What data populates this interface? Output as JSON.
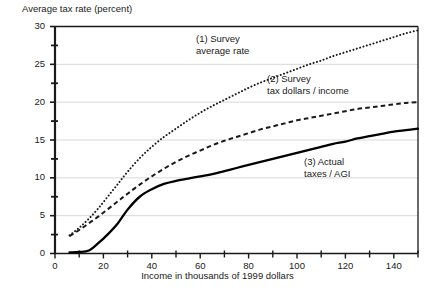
{
  "chart_data": {
    "type": "line",
    "title": "",
    "ylabel": "Average tax rate (percent)",
    "xlabel": "Income in thousands of 1999 dollars",
    "xlim": [
      0,
      150
    ],
    "ylim": [
      0,
      30
    ],
    "grid": true,
    "grid_axis": "y",
    "legend_position": "inline-annotations",
    "y_ticks_major": [
      0,
      5,
      10,
      15,
      20,
      25,
      30
    ],
    "y_ticks_minor": [
      2.5,
      7.5,
      12.5,
      17.5,
      22.5,
      27.5
    ],
    "y_tick_labels": [
      "0",
      "5",
      "10",
      "15",
      "20",
      "25",
      "30"
    ],
    "x_ticks_major": [
      0,
      20,
      40,
      60,
      80,
      100,
      120,
      140
    ],
    "x_ticks_minor": [
      10,
      30,
      50,
      70,
      90,
      110,
      130,
      150
    ],
    "x_tick_labels": [
      "0",
      "20",
      "40",
      "60",
      "80",
      "100",
      "120",
      "140"
    ],
    "series": [
      {
        "name": "(1) Survey average rate",
        "label_line1": "(1) Survey",
        "label_line2": "average rate",
        "style": "dotted",
        "color": "#1a1a1a",
        "x": [
          6,
          10,
          14,
          18,
          22,
          26,
          30,
          35,
          40,
          45,
          50,
          55,
          60,
          65,
          70,
          75,
          80,
          85,
          90,
          95,
          100,
          105,
          110,
          115,
          120,
          125,
          130,
          135,
          140,
          145,
          150
        ],
        "y": [
          2.4,
          3.4,
          4.6,
          6.0,
          7.6,
          9.2,
          10.8,
          12.6,
          14.1,
          15.4,
          16.5,
          17.6,
          18.6,
          19.5,
          20.3,
          21.1,
          21.9,
          22.6,
          23.2,
          23.8,
          24.4,
          25.0,
          25.5,
          26.1,
          26.6,
          27.1,
          27.6,
          28.1,
          28.6,
          29.1,
          29.5
        ]
      },
      {
        "name": "(2) Survey tax dollars / income",
        "label_line1": "(2) Survey",
        "label_line2": "tax dollars / income",
        "style": "dashed",
        "color": "#1a1a1a",
        "x": [
          6,
          10,
          14,
          18,
          22,
          26,
          30,
          35,
          40,
          45,
          50,
          55,
          60,
          65,
          70,
          75,
          80,
          85,
          90,
          95,
          100,
          105,
          110,
          115,
          120,
          125,
          130,
          135,
          140,
          145,
          150
        ],
        "y": [
          2.3,
          3.1,
          4.0,
          4.9,
          5.9,
          6.9,
          7.9,
          9.1,
          10.2,
          11.2,
          12.1,
          12.9,
          13.6,
          14.3,
          14.9,
          15.4,
          15.9,
          16.4,
          16.8,
          17.2,
          17.6,
          17.9,
          18.2,
          18.5,
          18.8,
          19.1,
          19.3,
          19.5,
          19.7,
          19.9,
          20.0
        ]
      },
      {
        "name": "(3) Actual taxes / AGI",
        "label_line1": "(3) Actual",
        "label_line2": "taxes / AGI",
        "style": "solid",
        "color": "#000000",
        "x": [
          6,
          10,
          14,
          18,
          22,
          26,
          30,
          35,
          40,
          45,
          50,
          55,
          60,
          65,
          70,
          75,
          80,
          85,
          90,
          95,
          100,
          105,
          110,
          115,
          120,
          125,
          130,
          135,
          140,
          145,
          150
        ],
        "y": [
          0.15,
          0.2,
          0.4,
          1.4,
          2.6,
          4.0,
          5.8,
          7.5,
          8.5,
          9.2,
          9.6,
          9.9,
          10.2,
          10.5,
          10.9,
          11.3,
          11.7,
          12.1,
          12.5,
          12.9,
          13.3,
          13.7,
          14.1,
          14.5,
          14.8,
          15.2,
          15.5,
          15.8,
          16.1,
          16.3,
          16.5
        ]
      }
    ]
  },
  "annotations": {
    "series1": {
      "line1": "(1) Survey",
      "line2": "average rate"
    },
    "series2": {
      "line1": "(2) Survey",
      "line2": "tax dollars / income"
    },
    "series3": {
      "line1": "(3) Actual",
      "line2": "taxes / AGI"
    }
  },
  "axis": {
    "y_title": "Average tax rate (percent)",
    "x_title": "Income in thousands of 1999 dollars"
  }
}
